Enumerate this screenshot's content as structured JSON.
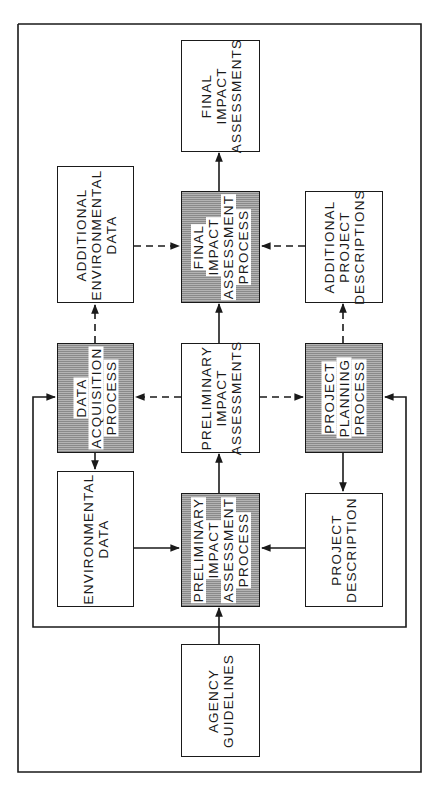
{
  "diagram": {
    "frame_color": "#1a1a1a",
    "shaded_fill": "#9c9c9c",
    "nodes": {
      "final_impact_assessments": {
        "lines": [
          "FINAL",
          "IMPACT",
          "ASSESSMENTS"
        ],
        "shaded": false
      },
      "additional_environmental_data": {
        "lines": [
          "ADDITIONAL",
          "ENVIRONMENTAL",
          "DATA"
        ],
        "shaded": false
      },
      "final_impact_assessment_process": {
        "lines": [
          "FINAL",
          "IMPACT",
          "ASSESSMENT",
          "PROCESS"
        ],
        "shaded": true
      },
      "additional_project_descriptions": {
        "lines": [
          "ADDITIONAL",
          "PROJECT",
          "DESCRIPTIONS"
        ],
        "shaded": false
      },
      "data_acquisition_process": {
        "lines": [
          "DATA",
          "ACQUISITION",
          "PROCESS"
        ],
        "shaded": true
      },
      "preliminary_impact_assessments": {
        "lines": [
          "PRELIMINARY",
          "IMPACT",
          "ASSESSMENTS"
        ],
        "shaded": false
      },
      "project_planning_process": {
        "lines": [
          "PROJECT",
          "PLANNING",
          "PROCESS"
        ],
        "shaded": true
      },
      "environmental_data": {
        "lines": [
          "ENVIRONMENTAL",
          "DATA"
        ],
        "shaded": false
      },
      "preliminary_impact_assessment_process": {
        "lines": [
          "PRELIMINARY",
          "IMPACT",
          "ASSESSMENT",
          "PROCESS"
        ],
        "shaded": true
      },
      "project_description": {
        "lines": [
          "PROJECT",
          "DESCRIPTION"
        ],
        "shaded": false
      },
      "agency_guidelines": {
        "lines": [
          "AGENCY",
          "GUIDELINES"
        ],
        "shaded": false
      }
    },
    "edges": [
      {
        "from": "agency_guidelines",
        "to": "preliminary_impact_assessment_process",
        "style": "solid"
      },
      {
        "from": "environmental_data",
        "to": "preliminary_impact_assessment_process",
        "style": "solid"
      },
      {
        "from": "project_description",
        "to": "preliminary_impact_assessment_process",
        "style": "solid"
      },
      {
        "from": "preliminary_impact_assessment_process",
        "to": "preliminary_impact_assessments",
        "style": "solid"
      },
      {
        "from": "preliminary_impact_assessments",
        "to": "data_acquisition_process",
        "style": "dashed"
      },
      {
        "from": "preliminary_impact_assessments",
        "to": "project_planning_process",
        "style": "dashed"
      },
      {
        "from": "data_acquisition_process",
        "to": "environmental_data",
        "style": "solid"
      },
      {
        "from": "project_planning_process",
        "to": "project_description",
        "style": "solid"
      },
      {
        "from": "data_acquisition_process",
        "to": "additional_environmental_data",
        "style": "dashed"
      },
      {
        "from": "project_planning_process",
        "to": "additional_project_descriptions",
        "style": "dashed"
      },
      {
        "from": "preliminary_impact_assessments",
        "to": "final_impact_assessment_process",
        "style": "solid"
      },
      {
        "from": "additional_environmental_data",
        "to": "final_impact_assessment_process",
        "style": "dashed"
      },
      {
        "from": "additional_project_descriptions",
        "to": "final_impact_assessment_process",
        "style": "dashed"
      },
      {
        "from": "final_impact_assessment_process",
        "to": "final_impact_assessments",
        "style": "solid"
      },
      {
        "from": "agency_guidelines",
        "to": "data_acquisition_process",
        "style": "solid",
        "note": "feedback loop via bottom bus"
      },
      {
        "from": "agency_guidelines",
        "to": "project_planning_process",
        "style": "solid",
        "note": "feedback loop via bottom bus"
      }
    ]
  }
}
